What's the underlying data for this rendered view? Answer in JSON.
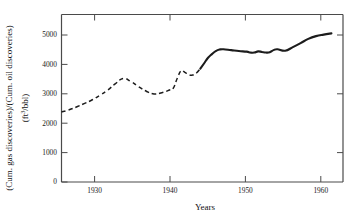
{
  "chart_data": {
    "type": "line",
    "title": "",
    "xlabel": "Years",
    "ylabel": "(Cum. gas discoveries)/(Cum. oil discoveries)",
    "ylabel_units": "(ft3/bbl)",
    "ylabel_units_base": "(ft",
    "ylabel_units_exp": "3",
    "ylabel_units_tail": "/bbl)",
    "xlim": [
      1926,
      1962.5
    ],
    "ylim": [
      0,
      5500
    ],
    "xticks": [
      1930,
      1940,
      1950,
      1960
    ],
    "xtick_labels": [
      "1930",
      "1940",
      "1950",
      "1960"
    ],
    "yticks": [
      0,
      1000,
      2000,
      3000,
      4000,
      5000
    ],
    "ytick_labels": [
      "0",
      "1000",
      "2000",
      "3000",
      "4000",
      "5000"
    ],
    "grid": false,
    "legend": "none",
    "line_color": "#1c1c1c",
    "axis_color": "#4a4a4a",
    "background_color": "#ffffff",
    "series": [
      {
        "name": "gas-to-oil discovery ratio (estimated)",
        "style": "dashed",
        "x": [
          1926.0,
          1927.0,
          1928.0,
          1929.0,
          1930.0,
          1931.0,
          1932.0,
          1933.0,
          1934.0,
          1935.0,
          1936.0,
          1937.0,
          1938.0,
          1939.0,
          1940.0,
          1940.5,
          1941.0,
          1941.5,
          1942.0,
          1942.5,
          1943.0,
          1943.5,
          1944.0
        ],
        "y": [
          2300,
          2370,
          2470,
          2580,
          2700,
          2850,
          3020,
          3230,
          3400,
          3300,
          3130,
          2980,
          2890,
          2930,
          3020,
          3080,
          3400,
          3650,
          3600,
          3520,
          3510,
          3580,
          3720
        ]
      },
      {
        "name": "gas-to-oil discovery ratio (measured)",
        "style": "solid",
        "x": [
          1944.0,
          1944.5,
          1945.0,
          1945.5,
          1946.0,
          1946.5,
          1947.0,
          1948.0,
          1949.0,
          1950.0,
          1950.5,
          1951.0,
          1951.5,
          1952.0,
          1952.5,
          1953.0,
          1953.5,
          1954.0,
          1955.0,
          1956.0,
          1957.0,
          1958.0,
          1959.0,
          1960.0,
          1961.0
        ],
        "y": [
          3720,
          3900,
          4080,
          4200,
          4300,
          4350,
          4360,
          4330,
          4300,
          4280,
          4250,
          4250,
          4290,
          4270,
          4250,
          4260,
          4330,
          4360,
          4310,
          4430,
          4560,
          4700,
          4790,
          4840,
          4880
        ]
      }
    ]
  }
}
